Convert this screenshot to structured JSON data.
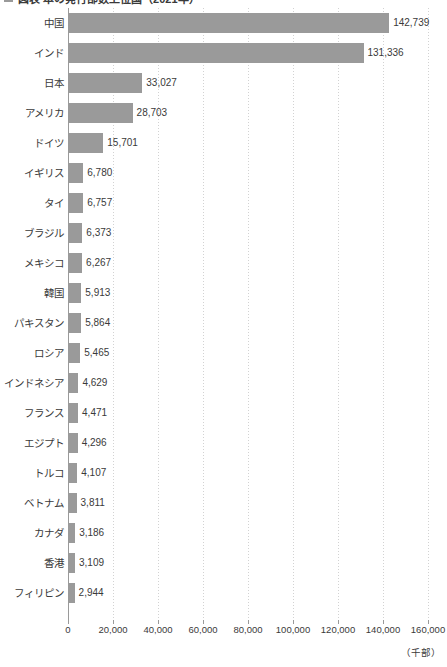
{
  "title": {
    "marker_icon": "legend-square-icon",
    "text": "図表 本の発行部数上位国（2021年）"
  },
  "axis_unit": "（千部）",
  "colors": {
    "bar": "#9a9a9a",
    "grid": "#d2d2d2",
    "axis": "#9a9a9a",
    "text": "#3a3a3a"
  },
  "chart_data": {
    "type": "bar",
    "orientation": "horizontal",
    "title": "図表 本の発行部数上位国（2021年）",
    "xlabel": "（千部）",
    "ylabel": "",
    "xlim": [
      0,
      160000
    ],
    "xticks": [
      0,
      20000,
      40000,
      60000,
      80000,
      100000,
      120000,
      140000,
      160000
    ],
    "xtick_labels": [
      "0",
      "20,000",
      "40,000",
      "60,000",
      "80,000",
      "100,000",
      "120,000",
      "140,000",
      "160,000"
    ],
    "grid": true,
    "legend": false,
    "categories": [
      "中国",
      "インド",
      "日本",
      "アメリカ",
      "ドイツ",
      "イギリス",
      "タイ",
      "ブラジル",
      "メキシコ",
      "韓国",
      "パキスタン",
      "ロシア",
      "インドネシア",
      "フランス",
      "エジプト",
      "トルコ",
      "ベトナム",
      "カナダ",
      "香港",
      "フィリピン"
    ],
    "values": [
      142739,
      131336,
      33027,
      28703,
      15701,
      6780,
      6757,
      6373,
      6267,
      5913,
      5864,
      5465,
      4629,
      4471,
      4296,
      4107,
      3811,
      3186,
      3109,
      2944
    ],
    "value_labels": [
      "142,739",
      "131,336",
      "33,027",
      "28,703",
      "15,701",
      "6,780",
      "6,757",
      "6,373",
      "6,267",
      "5,913",
      "5,864",
      "5,465",
      "4,629",
      "4,471",
      "4,296",
      "4,107",
      "3,811",
      "3,186",
      "3,109",
      "2,944"
    ]
  }
}
